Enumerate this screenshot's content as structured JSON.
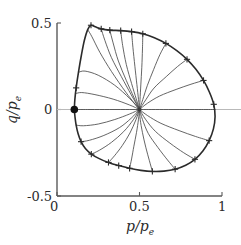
{
  "chart_data": {
    "type": "line",
    "title": "",
    "xlabel": "p/p_e",
    "ylabel": "q/p_e",
    "xlim": [
      0,
      1
    ],
    "ylim": [
      -0.5,
      0.5
    ],
    "grid": false,
    "legend": "none",
    "xticks": [
      {
        "value": 0,
        "label": "0"
      },
      {
        "value": 0.5,
        "label": "0.5"
      },
      {
        "value": 1,
        "label": "1"
      }
    ],
    "yticks": [
      {
        "value": 0.5,
        "label": "0.5"
      },
      {
        "value": 0,
        "label": "0"
      },
      {
        "value": -0.5,
        "label": "-0.5"
      }
    ],
    "annotations": [
      {
        "name": "focus-point",
        "x": 0.5,
        "y": 0.0,
        "marker": "convergence"
      },
      {
        "name": "source-point",
        "x": 0.105,
        "y": 0.0,
        "marker": "filled-dot"
      }
    ],
    "boundary": {
      "name": "separatrix",
      "marker": "plus",
      "points": [
        [
          0.105,
          0.0
        ],
        [
          0.108,
          0.055
        ],
        [
          0.116,
          0.125
        ],
        [
          0.13,
          0.215
        ],
        [
          0.148,
          0.315
        ],
        [
          0.166,
          0.4
        ],
        [
          0.186,
          0.462
        ],
        [
          0.206,
          0.487
        ],
        [
          0.232,
          0.478
        ],
        [
          0.268,
          0.466
        ],
        [
          0.32,
          0.459
        ],
        [
          0.386,
          0.456
        ],
        [
          0.452,
          0.45
        ],
        [
          0.52,
          0.438
        ],
        [
          0.59,
          0.415
        ],
        [
          0.66,
          0.382
        ],
        [
          0.726,
          0.34
        ],
        [
          0.788,
          0.29
        ],
        [
          0.842,
          0.232
        ],
        [
          0.888,
          0.168
        ],
        [
          0.924,
          0.1
        ],
        [
          0.95,
          0.03
        ],
        [
          0.958,
          -0.04
        ],
        [
          0.948,
          -0.112
        ],
        [
          0.922,
          -0.18
        ],
        [
          0.884,
          -0.24
        ],
        [
          0.836,
          -0.288
        ],
        [
          0.78,
          -0.322
        ],
        [
          0.716,
          -0.345
        ],
        [
          0.648,
          -0.356
        ],
        [
          0.578,
          -0.358
        ],
        [
          0.508,
          -0.352
        ],
        [
          0.44,
          -0.34
        ],
        [
          0.374,
          -0.324
        ],
        [
          0.312,
          -0.306
        ],
        [
          0.256,
          -0.284
        ],
        [
          0.208,
          -0.258
        ],
        [
          0.172,
          -0.226
        ],
        [
          0.146,
          -0.186
        ],
        [
          0.128,
          -0.14
        ],
        [
          0.116,
          -0.09
        ],
        [
          0.109,
          -0.042
        ],
        [
          0.105,
          0.0
        ]
      ],
      "tick_points": [
        [
          0.206,
          0.487
        ],
        [
          0.268,
          0.466
        ],
        [
          0.32,
          0.459
        ],
        [
          0.386,
          0.456
        ],
        [
          0.452,
          0.45
        ],
        [
          0.52,
          0.438
        ],
        [
          0.66,
          0.382
        ],
        [
          0.788,
          0.29
        ],
        [
          0.888,
          0.168
        ],
        [
          0.95,
          0.03
        ],
        [
          0.922,
          -0.18
        ],
        [
          0.836,
          -0.288
        ],
        [
          0.716,
          -0.345
        ],
        [
          0.578,
          -0.358
        ],
        [
          0.44,
          -0.34
        ],
        [
          0.374,
          -0.324
        ],
        [
          0.312,
          -0.306
        ],
        [
          0.208,
          -0.258
        ],
        [
          0.146,
          -0.186
        ],
        [
          0.116,
          0.125
        ]
      ]
    },
    "series": [
      {
        "name": "ray-1",
        "angle_deg": 0,
        "values": [
          [
            0.105,
            0.0
          ],
          [
            0.2,
            0.0
          ],
          [
            0.32,
            0.0
          ],
          [
            0.44,
            0.0
          ],
          [
            0.5,
            0.0
          ]
        ]
      },
      {
        "name": "ray-2",
        "angle_deg": 12,
        "values": [
          [
            0.114,
            0.092
          ],
          [
            0.15,
            0.098
          ],
          [
            0.23,
            0.086
          ],
          [
            0.34,
            0.06
          ],
          [
            0.44,
            0.026
          ],
          [
            0.5,
            0.0
          ]
        ]
      },
      {
        "name": "ray-3",
        "angle_deg": 26,
        "values": [
          [
            0.13,
            0.215
          ],
          [
            0.17,
            0.222
          ],
          [
            0.25,
            0.198
          ],
          [
            0.35,
            0.14
          ],
          [
            0.44,
            0.064
          ],
          [
            0.5,
            0.0
          ]
        ]
      },
      {
        "name": "ray-4",
        "angle_deg": 42,
        "values": [
          [
            0.186,
            0.462
          ],
          [
            0.212,
            0.42
          ],
          [
            0.26,
            0.33
          ],
          [
            0.33,
            0.22
          ],
          [
            0.42,
            0.096
          ],
          [
            0.5,
            0.0
          ]
        ]
      },
      {
        "name": "ray-5",
        "angle_deg": 58,
        "values": [
          [
            0.268,
            0.466
          ],
          [
            0.29,
            0.4
          ],
          [
            0.33,
            0.3
          ],
          [
            0.39,
            0.19
          ],
          [
            0.45,
            0.085
          ],
          [
            0.5,
            0.0
          ]
        ]
      },
      {
        "name": "ray-6",
        "angle_deg": 72,
        "values": [
          [
            0.32,
            0.459
          ],
          [
            0.34,
            0.385
          ],
          [
            0.372,
            0.28
          ],
          [
            0.42,
            0.168
          ],
          [
            0.465,
            0.072
          ],
          [
            0.5,
            0.0
          ]
        ]
      },
      {
        "name": "ray-7",
        "angle_deg": 86,
        "values": [
          [
            0.386,
            0.456
          ],
          [
            0.398,
            0.37
          ],
          [
            0.42,
            0.26
          ],
          [
            0.452,
            0.15
          ],
          [
            0.48,
            0.062
          ],
          [
            0.5,
            0.0
          ]
        ]
      },
      {
        "name": "ray-8",
        "angle_deg": 100,
        "values": [
          [
            0.452,
            0.45
          ],
          [
            0.46,
            0.36
          ],
          [
            0.472,
            0.25
          ],
          [
            0.484,
            0.145
          ],
          [
            0.494,
            0.058
          ],
          [
            0.5,
            0.0
          ]
        ]
      },
      {
        "name": "ray-9",
        "angle_deg": 114,
        "values": [
          [
            0.52,
            0.438
          ],
          [
            0.518,
            0.35
          ],
          [
            0.514,
            0.244
          ],
          [
            0.508,
            0.142
          ],
          [
            0.503,
            0.056
          ],
          [
            0.5,
            0.0
          ]
        ]
      },
      {
        "name": "ray-10",
        "angle_deg": 130,
        "values": [
          [
            0.66,
            0.382
          ],
          [
            0.624,
            0.318
          ],
          [
            0.586,
            0.232
          ],
          [
            0.548,
            0.14
          ],
          [
            0.52,
            0.058
          ],
          [
            0.5,
            0.0
          ]
        ]
      },
      {
        "name": "ray-11",
        "angle_deg": 150,
        "values": [
          [
            0.788,
            0.29
          ],
          [
            0.73,
            0.248
          ],
          [
            0.662,
            0.19
          ],
          [
            0.588,
            0.124
          ],
          [
            0.538,
            0.056
          ],
          [
            0.5,
            0.0
          ]
        ]
      },
      {
        "name": "ray-12",
        "angle_deg": 168,
        "values": [
          [
            0.888,
            0.168
          ],
          [
            0.812,
            0.146
          ],
          [
            0.722,
            0.116
          ],
          [
            0.622,
            0.078
          ],
          [
            0.548,
            0.036
          ],
          [
            0.5,
            0.0
          ]
        ]
      },
      {
        "name": "ray-13",
        "angle_deg": 180,
        "values": [
          [
            0.958,
            0.0
          ],
          [
            0.86,
            0.0
          ],
          [
            0.74,
            0.0
          ],
          [
            0.62,
            0.0
          ],
          [
            0.54,
            0.0
          ],
          [
            0.5,
            0.0
          ]
        ]
      },
      {
        "name": "ray-14",
        "angle_deg": 195,
        "values": [
          [
            0.922,
            -0.18
          ],
          [
            0.84,
            -0.156
          ],
          [
            0.74,
            -0.122
          ],
          [
            0.63,
            -0.08
          ],
          [
            0.55,
            -0.036
          ],
          [
            0.5,
            0.0
          ]
        ]
      },
      {
        "name": "ray-15",
        "angle_deg": 210,
        "values": [
          [
            0.836,
            -0.288
          ],
          [
            0.768,
            -0.25
          ],
          [
            0.684,
            -0.194
          ],
          [
            0.596,
            -0.126
          ],
          [
            0.536,
            -0.056
          ],
          [
            0.5,
            0.0
          ]
        ]
      },
      {
        "name": "ray-16",
        "angle_deg": 226,
        "values": [
          [
            0.716,
            -0.345
          ],
          [
            0.67,
            -0.292
          ],
          [
            0.612,
            -0.22
          ],
          [
            0.554,
            -0.14
          ],
          [
            0.518,
            -0.058
          ],
          [
            0.5,
            0.0
          ]
        ]
      },
      {
        "name": "ray-17",
        "angle_deg": 242,
        "values": [
          [
            0.578,
            -0.358
          ],
          [
            0.56,
            -0.296
          ],
          [
            0.538,
            -0.218
          ],
          [
            0.518,
            -0.134
          ],
          [
            0.504,
            -0.056
          ],
          [
            0.5,
            0.0
          ]
        ]
      },
      {
        "name": "ray-18",
        "angle_deg": 256,
        "values": [
          [
            0.44,
            -0.34
          ],
          [
            0.452,
            -0.286
          ],
          [
            0.466,
            -0.212
          ],
          [
            0.482,
            -0.132
          ],
          [
            0.494,
            -0.056
          ],
          [
            0.5,
            0.0
          ]
        ]
      },
      {
        "name": "ray-19",
        "angle_deg": 270,
        "values": [
          [
            0.312,
            -0.306
          ],
          [
            0.348,
            -0.268
          ],
          [
            0.396,
            -0.208
          ],
          [
            0.442,
            -0.136
          ],
          [
            0.478,
            -0.06
          ],
          [
            0.5,
            0.0
          ]
        ]
      },
      {
        "name": "ray-20",
        "angle_deg": 288,
        "values": [
          [
            0.208,
            -0.258
          ],
          [
            0.256,
            -0.236
          ],
          [
            0.33,
            -0.19
          ],
          [
            0.404,
            -0.128
          ],
          [
            0.462,
            -0.06
          ],
          [
            0.5,
            0.0
          ]
        ]
      },
      {
        "name": "ray-21",
        "angle_deg": 306,
        "values": [
          [
            0.146,
            -0.186
          ],
          [
            0.196,
            -0.178
          ],
          [
            0.284,
            -0.15
          ],
          [
            0.38,
            -0.104
          ],
          [
            0.45,
            -0.05
          ],
          [
            0.5,
            0.0
          ]
        ]
      },
      {
        "name": "ray-22",
        "angle_deg": 330,
        "values": [
          [
            0.116,
            -0.09
          ],
          [
            0.16,
            -0.094
          ],
          [
            0.25,
            -0.084
          ],
          [
            0.35,
            -0.058
          ],
          [
            0.44,
            -0.026
          ],
          [
            0.5,
            0.0
          ]
        ]
      }
    ]
  },
  "styles": {
    "axis_color": "#5a5a5a",
    "curve_color": "#4a4a4a",
    "boundary_color": "#2b2b2b",
    "text_color": "#2b2b2b",
    "background": "#ffffff"
  }
}
